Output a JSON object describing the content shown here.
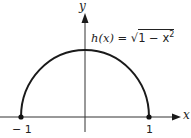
{
  "diagram": {
    "function_label": "h(x) = √1 − x²",
    "function_label_parts": {
      "lhs": "h(x) = ",
      "radicand": "1 − x",
      "exponent": "2"
    },
    "x_axis_label": "x",
    "y_axis_label": "y",
    "tick_labels": {
      "left": "− 1",
      "right": "1"
    },
    "curve": "upper semicircle of radius 1 centered at origin",
    "endpoints": [
      {
        "x": -1,
        "y": 0
      },
      {
        "x": 1,
        "y": 0
      }
    ],
    "colors": {
      "stroke": "#1a1a1a",
      "axis": "#333333",
      "text": "#222222"
    }
  }
}
